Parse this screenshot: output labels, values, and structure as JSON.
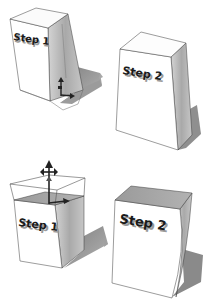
{
  "figure": {
    "colors": {
      "background": "#ffffff",
      "face_light": "#ffffff",
      "face_side": "#b8b8b8",
      "face_top_shaded": "#9e9e9e",
      "shadow": "#8c8c8c",
      "edge": "#3a3a3a",
      "selection": "#555555",
      "cursor": "#222222"
    },
    "panels": [
      {
        "id": "top-left",
        "label": "Step 1",
        "state": "selected-with-move-cursor"
      },
      {
        "id": "top-right",
        "label": "Step 2",
        "state": "result"
      },
      {
        "id": "bottom-left",
        "label": "Step 1",
        "state": "selected-with-move-cursor"
      },
      {
        "id": "bottom-right",
        "label": "Step 2",
        "state": "result"
      }
    ]
  }
}
